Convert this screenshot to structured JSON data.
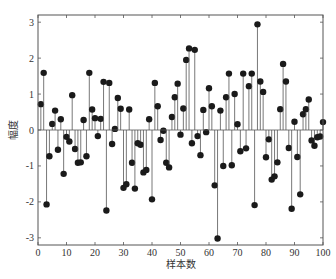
{
  "chart_data": {
    "type": "stem",
    "title": "",
    "xlabel": "样本数",
    "ylabel": "幅度",
    "xlim": [
      0,
      100
    ],
    "ylim": [
      -3.2,
      3.2
    ],
    "xticks": [
      0,
      10,
      20,
      30,
      40,
      50,
      60,
      70,
      80,
      90,
      100
    ],
    "yticks": [
      -3,
      -2,
      -1,
      0,
      1,
      2,
      3
    ],
    "grid": false,
    "legend": null,
    "marker": "filled-circle",
    "colors": {
      "stem": "#555555",
      "marker": "#1a1a1a",
      "axis": "#555555",
      "baseline": "#555555"
    },
    "x": [
      1,
      2,
      3,
      4,
      5,
      6,
      7,
      8,
      9,
      10,
      11,
      12,
      13,
      14,
      15,
      16,
      17,
      18,
      19,
      20,
      21,
      22,
      23,
      24,
      25,
      26,
      27,
      28,
      29,
      30,
      31,
      32,
      33,
      34,
      35,
      36,
      37,
      38,
      39,
      40,
      41,
      42,
      43,
      44,
      45,
      46,
      47,
      48,
      49,
      50,
      51,
      52,
      53,
      54,
      55,
      56,
      57,
      58,
      59,
      60,
      61,
      62,
      63,
      64,
      65,
      66,
      67,
      68,
      69,
      70,
      71,
      72,
      73,
      74,
      75,
      76,
      77,
      78,
      79,
      80,
      81,
      82,
      83,
      84,
      85,
      86,
      87,
      88,
      89,
      90,
      91,
      92,
      93,
      94,
      95,
      96,
      97,
      98,
      99,
      100
    ],
    "values": [
      0.72,
      1.59,
      -2.07,
      -0.73,
      0.17,
      0.54,
      -0.55,
      0.3,
      -1.22,
      -0.19,
      -0.32,
      0.97,
      -0.53,
      -0.91,
      -0.9,
      0.28,
      -0.73,
      1.59,
      0.57,
      0.33,
      -0.17,
      0.31,
      1.34,
      -2.24,
      1.31,
      -0.39,
      0.03,
      0.89,
      0.59,
      -1.61,
      -1.51,
      0.57,
      -0.91,
      -1.63,
      -0.37,
      -0.41,
      -1.18,
      -1.11,
      0.3,
      -1.93,
      1.31,
      0.66,
      -0.28,
      -0.02,
      -0.91,
      -1.04,
      0.36,
      0.91,
      1.29,
      -0.13,
      0.6,
      1.95,
      2.27,
      -0.37,
      2.23,
      -0.17,
      -0.7,
      0.56,
      -0.06,
      1.16,
      0.66,
      -1.54,
      -3.02,
      0.54,
      -1.0,
      0.91,
      1.57,
      -0.98,
      1.0,
      0.16,
      -0.59,
      1.57,
      -0.51,
      1.22,
      1.57,
      -2.09,
      2.94,
      1.35,
      1.06,
      -0.76,
      -0.26,
      -1.38,
      -1.29,
      -0.9,
      0.58,
      1.84,
      1.35,
      -0.5,
      -2.19,
      0.23,
      -0.75,
      -1.79,
      0.44,
      0.58,
      0.85,
      -0.29,
      -0.44,
      -0.2,
      -0.18,
      0.22
    ]
  }
}
